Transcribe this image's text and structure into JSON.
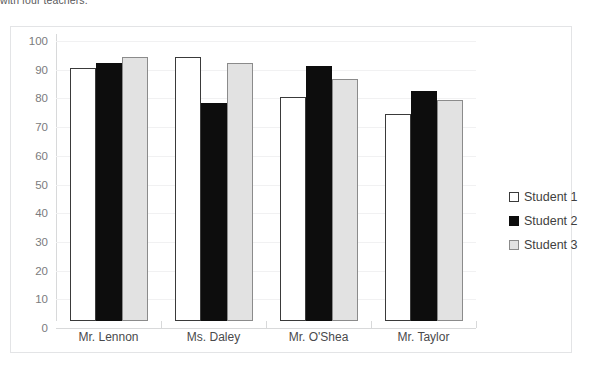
{
  "caption": {
    "text": "with four teachers."
  },
  "chart_data": {
    "type": "bar",
    "title": "",
    "xlabel": "",
    "ylabel": "",
    "categories": [
      "Mr. Lennon",
      "Ms. Daley",
      "Mr. O'Shea",
      "Mr. Taylor"
    ],
    "series": [
      {
        "name": "Student 1",
        "values": [
          88,
          92,
          78,
          72
        ],
        "color": "#ffffff"
      },
      {
        "name": "Student 2",
        "values": [
          90,
          76,
          89,
          80
        ],
        "color": "#0d0d0d"
      },
      {
        "name": "Student 3",
        "values": [
          92,
          90,
          84.5,
          77
        ],
        "color": "#e2e2e2"
      }
    ],
    "ylim": [
      0,
      100
    ],
    "yticks": [
      100,
      90,
      80,
      70,
      60,
      50,
      40,
      30,
      20,
      10,
      0
    ],
    "ytick_labels": [
      "100",
      "90",
      "80",
      "70",
      "60",
      "50",
      "40",
      "30",
      "20",
      "10",
      "0"
    ],
    "grid": true,
    "legend_position": "right",
    "legend_entries": [
      "Student 1",
      "Student 2",
      "Student 3"
    ]
  }
}
